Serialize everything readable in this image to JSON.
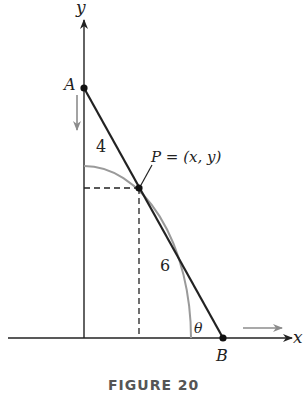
{
  "figure": {
    "caption": "FIGURE 20",
    "axes": {
      "x_label": "x",
      "y_label": "y"
    },
    "points": {
      "A": {
        "label": "A"
      },
      "B": {
        "label": "B"
      },
      "P": {
        "label": "P = (x, y)"
      }
    },
    "segment_labels": {
      "upper": "4",
      "lower": "6"
    },
    "angle_label": "θ",
    "colors": {
      "ink": "#222222",
      "arc": "#9a9a9a",
      "arrow": "#8c8c8c"
    }
  }
}
